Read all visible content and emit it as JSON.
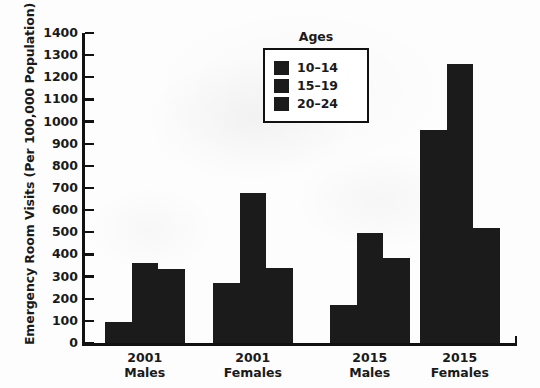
{
  "chart_data": {
    "type": "bar",
    "title": "",
    "xlabel": "",
    "ylabel": "Emergency Room Visits (Per 100,000 Population)",
    "ylim": [
      0,
      1400
    ],
    "ytick_step": 100,
    "yticks": [
      1400,
      1300,
      1200,
      1100,
      1000,
      900,
      800,
      700,
      600,
      500,
      400,
      300,
      200,
      100,
      0
    ],
    "ytick_labels": [
      "1400",
      "1300",
      "1200",
      "1100",
      "1000",
      "900",
      "800",
      "700",
      "600",
      "500",
      "400",
      "300",
      "200",
      "100",
      "0"
    ],
    "grid": false,
    "legend_title": "Ages",
    "legend_position": "upper center",
    "categories": [
      "2001 Males",
      "2001 Females",
      "2015 Males",
      "2015 Females"
    ],
    "category_lines": [
      [
        "2001",
        "Males"
      ],
      [
        "2001",
        "Females"
      ],
      [
        "2015",
        "Males"
      ],
      [
        "2015",
        "Females"
      ]
    ],
    "series": [
      {
        "name": "10–14",
        "color": "#1b1b1b",
        "values": [
          95,
          272,
          172,
          963
        ]
      },
      {
        "name": "15–19",
        "color": "#1b1b1b",
        "values": [
          361,
          678,
          497,
          1262
        ]
      },
      {
        "name": "20–24",
        "color": "#1b1b1b",
        "values": [
          332,
          339,
          386,
          518
        ]
      }
    ]
  },
  "legend": {
    "title": "Ages",
    "items": [
      {
        "label": "10–14",
        "swatch": "legend-swatch-10-14"
      },
      {
        "label": "15–19",
        "swatch": "legend-swatch-15-19"
      },
      {
        "label": "20–24",
        "swatch": "legend-swatch-20-24"
      }
    ]
  },
  "axes": {
    "y_title": "Emergency Room Visits (Per 100,000 Population)"
  }
}
